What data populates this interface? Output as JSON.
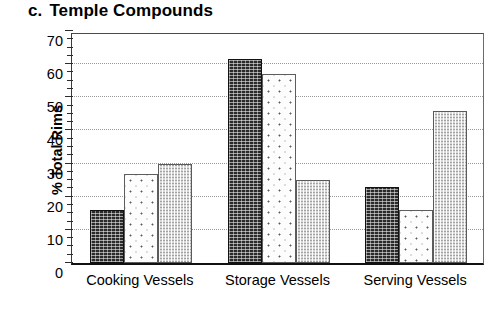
{
  "chart_data": {
    "type": "bar",
    "title_prefix": "c.",
    "title_text": "Temple Compounds",
    "xlabel": "",
    "ylabel": "% Total Rims",
    "ylim": [
      0,
      70
    ],
    "ytick_step": 10,
    "yticks": [
      0,
      10,
      20,
      30,
      40,
      50,
      60,
      70
    ],
    "ytick_labels": [
      "0",
      "10",
      "20",
      "30",
      "40",
      "50",
      "60",
      "70"
    ],
    "minor_tick_step": 2.5,
    "grid": "horizontal-dotted",
    "legend": "none",
    "categories": [
      "Cooking Vessels",
      "Storage Vessels",
      "Serving Vessels"
    ],
    "series": [
      {
        "name": "series-1",
        "pattern": "dark-stipple",
        "color": "#2a2a2a",
        "values": [
          16,
          61.5,
          23
        ]
      },
      {
        "name": "series-2",
        "pattern": "white-dotted",
        "color": "#fdfdfd",
        "values": [
          27,
          57,
          16
        ]
      },
      {
        "name": "series-3",
        "pattern": "light-gray-hatch",
        "color": "#d8d8d8",
        "values": [
          30,
          25,
          46
        ]
      }
    ]
  },
  "colors": {
    "background": "#ffffff",
    "axis": "#111111",
    "gridline": "#9a9a9a",
    "text": "#000000"
  }
}
